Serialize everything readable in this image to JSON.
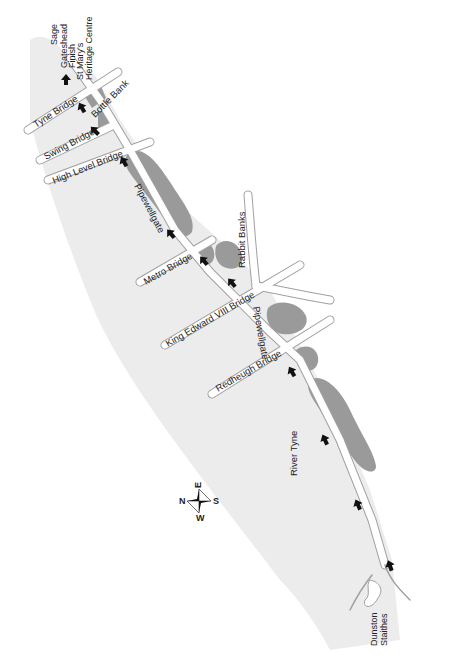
{
  "map": {
    "title": "River Tyne route map",
    "colors": {
      "river": "#ececec",
      "land": "#ffffff",
      "park": "#9a9a9a",
      "road": "#ffffff",
      "road_edge": "#a0a0a0",
      "arrow": "#111111",
      "text": "#222222"
    },
    "labels": {
      "sage": "Sage",
      "gateshead_finish": [
        "Gateshead",
        "Finish"
      ],
      "st_marys": [
        "St Mary's",
        "Heritage Centre"
      ],
      "tyne_bridge": "Tyne Bridge",
      "bottle_bank": "Bottle Bank",
      "swing_bridge": "Swing Bridge",
      "high_level_bridge": "High Level Bridge",
      "pipewellgate_1": "Pipewellgate",
      "metro_bridge": "Metro Bridge",
      "rabbit_banks": "Rabbit Banks",
      "king_edward_bridge": "King Edward VIII Bridge",
      "pipewellgate_2": "Pipewellgate",
      "redheugh_bridge": "Redheugh Bridge",
      "river_tyne": "River Tyne",
      "dunston_staithes": [
        "Dunston",
        "Staithes"
      ]
    },
    "compass": {
      "top": "E",
      "right": "S",
      "bottom": "W",
      "left": "N"
    },
    "route_arrows_count": 11
  }
}
